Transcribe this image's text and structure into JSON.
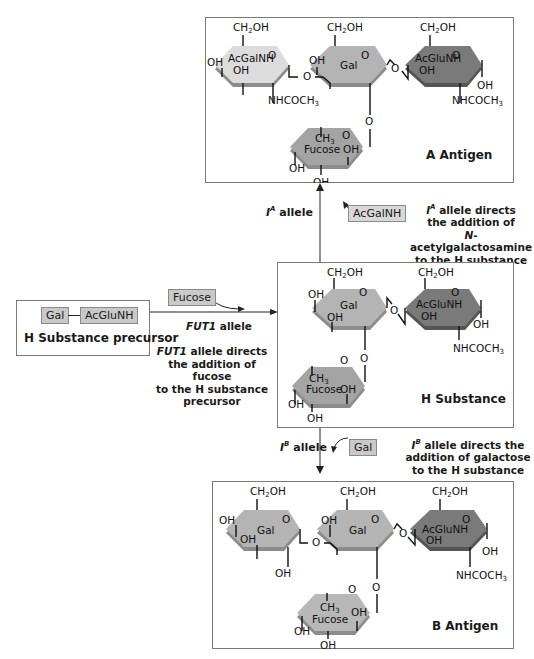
{
  "colors": {
    "acgalnh_ring": "#dcdcdc",
    "gal_ring": "#b4b4b4",
    "acglunh_ring": "#7a7a7a",
    "fucose_ring": "#a4a4a4",
    "ring_shadow": "#8c8c8c",
    "chip_fill": "#c9c9c9",
    "border": "#7a7a7a"
  },
  "precursor": {
    "chips": [
      "Gal",
      "AcGluNH"
    ],
    "title": "H Substance precursor"
  },
  "fut1_step": {
    "chip": "Fucose",
    "allele_label": "FUT1 allele",
    "note_lines": [
      "FUT1 allele directs",
      "the addition of fucose",
      "to the H substance",
      "precursor"
    ]
  },
  "a_step": {
    "allele_label": "I",
    "allele_sup": "A",
    "allele_suffix": " allele",
    "chip": "AcGalNH",
    "note_lines": [
      "allele directs",
      "the addition of",
      "N-acetylgalactosamine",
      "to the H substance"
    ]
  },
  "b_step": {
    "allele_label": "I",
    "allele_sup": "B",
    "allele_suffix": " allele",
    "chip": "Gal",
    "note_lines": [
      "allele directs the",
      "addition of galactose",
      "to the H substance"
    ]
  },
  "a_antigen": {
    "title": "A Antigen",
    "rings": [
      "AcGalNH",
      "Gal",
      "AcGluNH",
      "Fucose"
    ]
  },
  "h_substance": {
    "title": "H Substance",
    "rings": [
      "Gal",
      "AcGluNH",
      "Fucose"
    ]
  },
  "b_antigen": {
    "title": "B Antigen",
    "rings": [
      "Gal",
      "Gal",
      "AcGluNH",
      "Fucose"
    ]
  },
  "chem_labels": {
    "ch2oh": "CH2OH",
    "oh": "OH",
    "o": "O",
    "nhcoch3": "NHCOCH3",
    "ch3": "CH3"
  }
}
